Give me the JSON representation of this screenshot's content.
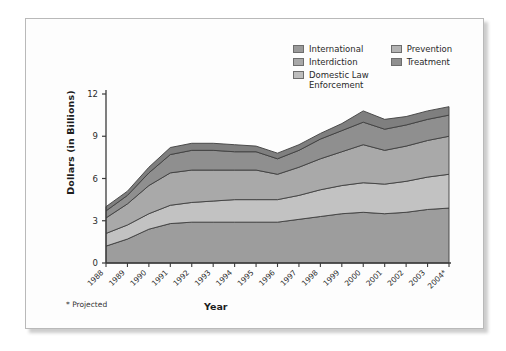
{
  "legend": {
    "columns": [
      {
        "items": [
          {
            "label": "International",
            "color": "#9a9a9a",
            "key": "international"
          },
          {
            "label": "Interdiction",
            "color": "#a8a8a8",
            "key": "interdiction"
          },
          {
            "label": "Domestic Law\nEnforcement",
            "color": "#bdbdbd",
            "key": "domestic-law-enforcement"
          }
        ]
      },
      {
        "items": [
          {
            "label": "Prevention",
            "color": "#b3b3b3",
            "key": "prevention"
          },
          {
            "label": "Treatment",
            "color": "#8f8f8f",
            "key": "treatment"
          }
        ]
      }
    ]
  },
  "axes": {
    "y_title": "Dollars (in Billions)",
    "x_title": "Year",
    "y_ticks": [
      "0",
      "3",
      "6",
      "9",
      "12"
    ],
    "footnote": "* Projected"
  },
  "chart_data": {
    "type": "area",
    "stacked": true,
    "title": "",
    "xlabel": "Year",
    "ylabel": "Dollars (in Billions)",
    "ylim": [
      0,
      12
    ],
    "ytick_values": [
      0,
      3,
      6,
      9,
      12
    ],
    "grid": false,
    "legend_position": "top-right",
    "annotations": [
      "* Projected"
    ],
    "categories": [
      "1988",
      "1989",
      "1990",
      "1991",
      "1992",
      "1993",
      "1994",
      "1995",
      "1996",
      "1997",
      "1998",
      "1999",
      "2000",
      "2001",
      "2002",
      "2003",
      "2004*"
    ],
    "series": [
      {
        "name": "Domestic Law Enforcement",
        "color": "#9d9d9d",
        "values": [
          1.2,
          1.7,
          2.4,
          2.8,
          2.9,
          2.9,
          2.9,
          2.9,
          2.9,
          3.1,
          3.3,
          3.5,
          3.6,
          3.5,
          3.6,
          3.8,
          3.9
        ]
      },
      {
        "name": "Treatment",
        "color": "#c2c2c2",
        "values": [
          0.9,
          1.0,
          1.1,
          1.3,
          1.4,
          1.5,
          1.6,
          1.6,
          1.6,
          1.7,
          1.9,
          2.0,
          2.1,
          2.1,
          2.2,
          2.3,
          2.4
        ]
      },
      {
        "name": "Interdiction",
        "color": "#a9a9a9",
        "values": [
          1.1,
          1.5,
          2.0,
          2.3,
          2.3,
          2.2,
          2.1,
          2.1,
          1.8,
          2.0,
          2.2,
          2.4,
          2.7,
          2.4,
          2.5,
          2.6,
          2.7
        ]
      },
      {
        "name": "Prevention",
        "color": "#8f8f8f",
        "values": [
          0.5,
          0.6,
          0.9,
          1.3,
          1.4,
          1.4,
          1.3,
          1.3,
          1.1,
          1.2,
          1.4,
          1.5,
          1.6,
          1.5,
          1.5,
          1.5,
          1.5
        ]
      },
      {
        "name": "International",
        "color": "#7f7f7f",
        "values": [
          0.3,
          0.3,
          0.4,
          0.5,
          0.5,
          0.5,
          0.5,
          0.4,
          0.4,
          0.4,
          0.4,
          0.5,
          0.8,
          0.7,
          0.6,
          0.6,
          0.6
        ]
      }
    ]
  }
}
